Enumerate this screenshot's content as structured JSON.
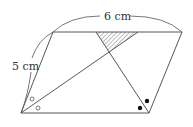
{
  "diagram": {
    "type": "geometry-parallelogram",
    "labels": {
      "top_side": "6 cm",
      "left_side": "5 cm"
    },
    "markers": {
      "bottom_left_angle": "open circles (bisected angle)",
      "bottom_right_angle": "filled circles (bisected angle)"
    },
    "shaded_region": "hatched triangle at top between two bisectors"
  }
}
